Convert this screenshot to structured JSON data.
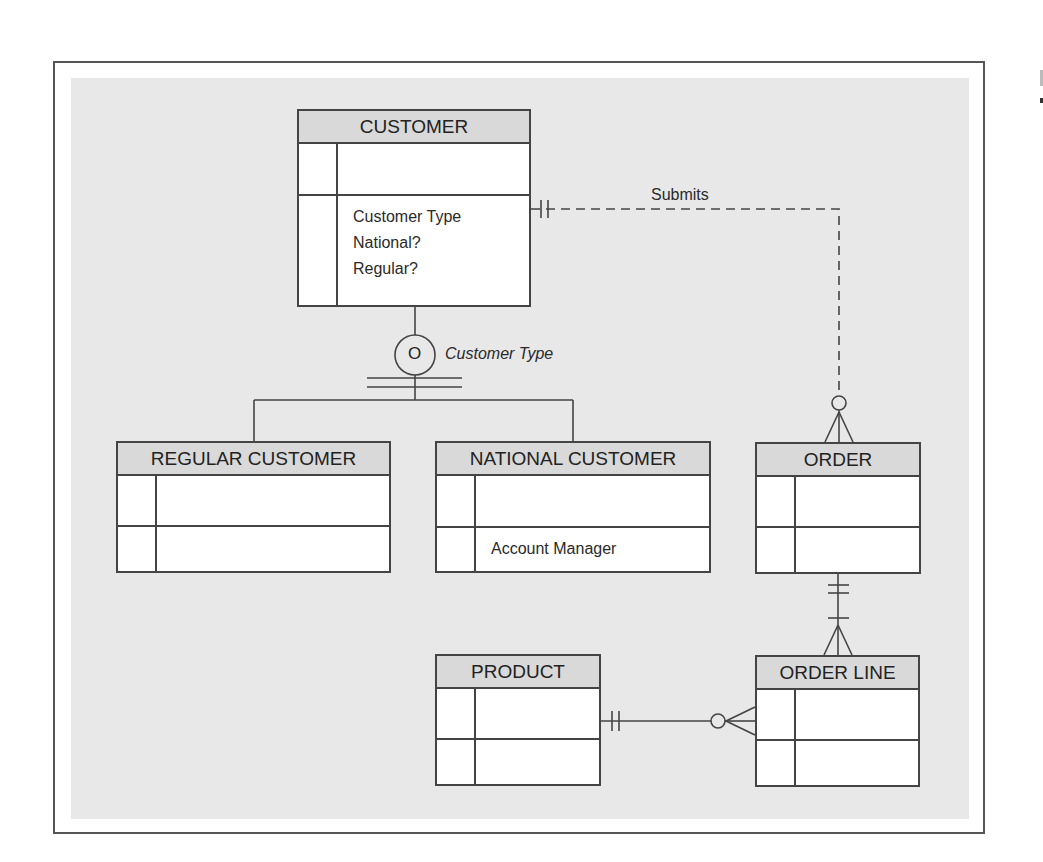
{
  "diagram": {
    "type": "EER diagram",
    "entities": {
      "customer": {
        "name": "CUSTOMER",
        "attributes": [
          "Customer Type",
          "National?",
          "Regular?"
        ]
      },
      "regular_customer": {
        "name": "REGULAR CUSTOMER",
        "attributes": []
      },
      "national_customer": {
        "name": "NATIONAL CUSTOMER",
        "attributes": [
          "Account Manager"
        ]
      },
      "order": {
        "name": "ORDER",
        "attributes": []
      },
      "order_line": {
        "name": "ORDER LINE",
        "attributes": []
      },
      "product": {
        "name": "PRODUCT",
        "attributes": []
      }
    },
    "specialization": {
      "symbol": "O",
      "discriminator": "Customer Type",
      "supertype": "CUSTOMER",
      "subtypes": [
        "REGULAR CUSTOMER",
        "NATIONAL CUSTOMER"
      ],
      "completeness": "total (double line)",
      "disjointness": "overlap"
    },
    "relationships": [
      {
        "label": "Submits",
        "from": "CUSTOMER",
        "to": "ORDER",
        "from_cardinality": "mandatory one",
        "to_cardinality": "optional many",
        "line_style": "dashed"
      },
      {
        "label": "",
        "from": "ORDER",
        "to": "ORDER LINE",
        "from_cardinality": "mandatory one",
        "to_cardinality": "mandatory many",
        "line_style": "solid"
      },
      {
        "label": "",
        "from": "PRODUCT",
        "to": "ORDER LINE",
        "from_cardinality": "mandatory one",
        "to_cardinality": "optional many",
        "line_style": "solid"
      }
    ]
  },
  "colors": {
    "background": "#e8e8e8",
    "entity_header": "#d9d9d9",
    "entity_body": "#ffffff",
    "line": "#444444"
  }
}
